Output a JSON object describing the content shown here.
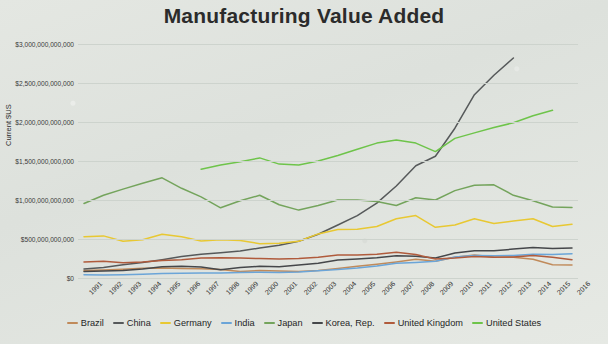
{
  "chart_data": {
    "type": "line",
    "title": "Manufacturing Value Added",
    "xlabel": "",
    "ylabel": "Current $US",
    "grid": true,
    "legend_position": "bottom",
    "ylim": [
      0,
      3000000000000
    ],
    "ytick_labels": [
      "$3,000,000,000,000",
      "$2,500,000,000,000",
      "$2,000,000,000,000",
      "$1,500,000,000,000",
      "$1,000,000,000,000",
      "$500,000,000,000",
      "$0"
    ],
    "ytick_values": [
      3000000000000,
      2500000000000,
      2000000000000,
      1500000000000,
      1000000000000,
      500000000000,
      0
    ],
    "categories": [
      "1991",
      "1992",
      "1993",
      "1994",
      "1995",
      "1996",
      "1997",
      "1998",
      "1999",
      "2000",
      "2001",
      "2002",
      "2003",
      "2004",
      "2005",
      "2006",
      "2007",
      "2008",
      "2009",
      "2010",
      "2011",
      "2012",
      "2013",
      "2014",
      "2015",
      "2016"
    ],
    "series": [
      {
        "name": "Brazil",
        "color": "#c08a5a",
        "values": [
          95000000000,
          102000000000,
          112000000000,
          125000000000,
          130000000000,
          122000000000,
          118000000000,
          110000000000,
          85000000000,
          95000000000,
          88000000000,
          82000000000,
          95000000000,
          120000000000,
          150000000000,
          175000000000,
          205000000000,
          240000000000,
          215000000000,
          265000000000,
          295000000000,
          270000000000,
          265000000000,
          240000000000,
          170000000000,
          165000000000
        ]
      },
      {
        "name": "China",
        "color": "#56595a",
        "values": [
          115000000000,
          135000000000,
          170000000000,
          200000000000,
          235000000000,
          275000000000,
          305000000000,
          325000000000,
          345000000000,
          385000000000,
          420000000000,
          470000000000,
          560000000000,
          680000000000,
          800000000000,
          960000000000,
          1180000000000,
          1440000000000,
          1560000000000,
          1920000000000,
          2350000000000,
          2600000000000,
          2820000000000,
          null,
          null,
          null
        ]
      },
      {
        "name": "Germany",
        "color": "#e8c832",
        "values": [
          530000000000,
          540000000000,
          470000000000,
          490000000000,
          560000000000,
          530000000000,
          475000000000,
          490000000000,
          480000000000,
          440000000000,
          445000000000,
          470000000000,
          565000000000,
          620000000000,
          625000000000,
          660000000000,
          760000000000,
          800000000000,
          650000000000,
          680000000000,
          760000000000,
          700000000000,
          730000000000,
          760000000000,
          660000000000,
          690000000000
        ]
      },
      {
        "name": "India",
        "color": "#6ba5d8",
        "values": [
          42000000000,
          40000000000,
          42000000000,
          48000000000,
          57000000000,
          62000000000,
          65000000000,
          65000000000,
          70000000000,
          73000000000,
          72000000000,
          78000000000,
          92000000000,
          110000000000,
          130000000000,
          155000000000,
          190000000000,
          200000000000,
          215000000000,
          270000000000,
          290000000000,
          285000000000,
          290000000000,
          305000000000,
          300000000000,
          310000000000
        ]
      },
      {
        "name": "Japan",
        "color": "#74a45c",
        "values": [
          955000000000,
          1060000000000,
          1140000000000,
          1215000000000,
          1285000000000,
          1150000000000,
          1040000000000,
          900000000000,
          990000000000,
          1060000000000,
          940000000000,
          870000000000,
          930000000000,
          1000000000000,
          1000000000000,
          980000000000,
          930000000000,
          1030000000000,
          1000000000000,
          1120000000000,
          1190000000000,
          1195000000000,
          1060000000000,
          990000000000,
          910000000000,
          905000000000
        ]
      },
      {
        "name": "Korea, Rep.",
        "color": "#45474a",
        "values": [
          85000000000,
          88000000000,
          98000000000,
          115000000000,
          145000000000,
          150000000000,
          140000000000,
          105000000000,
          135000000000,
          150000000000,
          145000000000,
          165000000000,
          190000000000,
          230000000000,
          245000000000,
          260000000000,
          285000000000,
          280000000000,
          255000000000,
          320000000000,
          350000000000,
          350000000000,
          370000000000,
          390000000000,
          380000000000,
          385000000000
        ]
      },
      {
        "name": "United Kingdom",
        "color": "#b05b3c",
        "values": [
          205000000000,
          215000000000,
          195000000000,
          205000000000,
          225000000000,
          235000000000,
          255000000000,
          260000000000,
          255000000000,
          250000000000,
          245000000000,
          250000000000,
          265000000000,
          295000000000,
          295000000000,
          305000000000,
          330000000000,
          300000000000,
          245000000000,
          255000000000,
          275000000000,
          265000000000,
          270000000000,
          290000000000,
          265000000000,
          235000000000
        ]
      },
      {
        "name": "United States",
        "color": "#6ec44a",
        "values": [
          null,
          null,
          null,
          null,
          null,
          null,
          1395000000000,
          1450000000000,
          1490000000000,
          1540000000000,
          1460000000000,
          1450000000000,
          1500000000000,
          1570000000000,
          1650000000000,
          1730000000000,
          1770000000000,
          1730000000000,
          1620000000000,
          1790000000000,
          1860000000000,
          1930000000000,
          1990000000000,
          2080000000000,
          2150000000000,
          null
        ]
      }
    ]
  },
  "legend": {
    "items": [
      {
        "label": "Brazil"
      },
      {
        "label": "China"
      },
      {
        "label": "Germany"
      },
      {
        "label": "India"
      },
      {
        "label": "Japan"
      },
      {
        "label": "Korea, Rep."
      },
      {
        "label": "United Kingdom"
      },
      {
        "label": "United States"
      }
    ]
  }
}
